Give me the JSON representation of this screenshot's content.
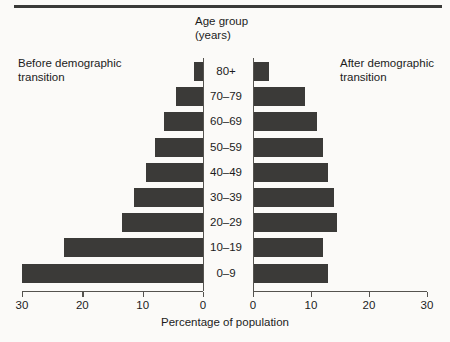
{
  "figure": {
    "center_heading_line1": "Age group",
    "center_heading_line2": "(years)",
    "left_caption_line1": "Before demographic",
    "left_caption_line2": "transition",
    "right_caption_line1": "After demographic",
    "right_caption_line2": "transition",
    "axis_title": "Percentage of population",
    "bar_color": "#3b3a38",
    "axis_color": "#55534f",
    "background_color": "#fbfaf8",
    "text_color": "#1c1c1c"
  },
  "chart_data": {
    "type": "bar",
    "title": "Age group (years)",
    "subtype": "population-pyramid",
    "xlabel": "Percentage of population",
    "ylabel": "Age group (years)",
    "categories": [
      "80+",
      "70–79",
      "60–69",
      "50–59",
      "40–49",
      "30–39",
      "20–29",
      "10–19",
      "0–9"
    ],
    "xlim": [
      0,
      30
    ],
    "xticks": [
      0,
      10,
      20,
      30
    ],
    "left_xticks_order": [
      30,
      20,
      10,
      0
    ],
    "right_xticks_order": [
      0,
      10,
      20,
      30
    ],
    "grid": false,
    "legend": "none",
    "series": [
      {
        "name": "Before demographic transition",
        "side": "left",
        "values": [
          1.5,
          4.5,
          6.5,
          8.0,
          9.5,
          11.5,
          13.5,
          23.0,
          30.0
        ]
      },
      {
        "name": "After demographic transition",
        "side": "right",
        "values": [
          2.8,
          9.0,
          11.0,
          12.0,
          13.0,
          14.0,
          14.5,
          12.0,
          13.0
        ]
      }
    ]
  }
}
